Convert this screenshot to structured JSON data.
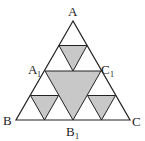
{
  "diagram": {
    "type": "sierpinski-triangle",
    "colors": {
      "line": "#222222",
      "fill": "#c8c8c8",
      "background": "#ffffff"
    },
    "labels": {
      "A": "A",
      "B": "B",
      "C": "C",
      "A1_main": "A",
      "A1_sub": "1",
      "B1_main": "B",
      "B1_sub": "1",
      "C1_main": "C",
      "C1_sub": "1"
    }
  }
}
